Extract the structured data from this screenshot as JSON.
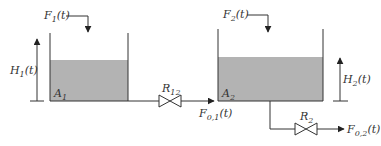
{
  "diagram": {
    "colors": {
      "liquid": "#b3b3b3",
      "line": "#333333",
      "background": "#ffffff"
    },
    "tank1": {
      "inflow": {
        "base": "F",
        "sub": "1",
        "arg": "(t)"
      },
      "level": {
        "base": "H",
        "sub": "1",
        "arg": "(t)"
      },
      "area": {
        "base": "A",
        "sub": "1"
      }
    },
    "tank2": {
      "inflow": {
        "base": "F",
        "sub": "2",
        "arg": "(t)"
      },
      "level": {
        "base": "H",
        "sub": "2",
        "arg": "(t)"
      },
      "area": {
        "base": "A",
        "sub": "2"
      }
    },
    "valve12": {
      "base": "R",
      "sub": "12"
    },
    "flow01": {
      "base": "F",
      "sub": "0,1",
      "arg": "(t)"
    },
    "valve2": {
      "base": "R",
      "sub": "2"
    },
    "flow02": {
      "base": "F",
      "sub": "0,2",
      "arg": "(t)"
    }
  }
}
